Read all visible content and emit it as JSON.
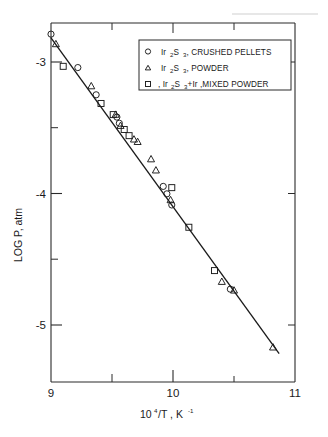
{
  "chart_data": {
    "type": "scatter",
    "title": "",
    "xlabel": "10^4 /T, K^-1",
    "ylabel": "LOG P, atm",
    "xlim": [
      9,
      11
    ],
    "ylim": [
      -5.6,
      -2.7
    ],
    "xticks": [
      9,
      10,
      11
    ],
    "xtick_labels": [
      "9",
      "10",
      "11"
    ],
    "x_minor_ticks": [
      9.5,
      10.5
    ],
    "yticks": [
      -3,
      -4,
      -5
    ],
    "ytick_labels": [
      "-3",
      "-4",
      "-5"
    ],
    "y_minor_ticks": [
      -3.5,
      -4.5
    ],
    "grid": false,
    "legend_position": "upper right",
    "fit_line": {
      "x": [
        9.0,
        10.87
      ],
      "y": [
        -2.82,
        -5.37
      ]
    },
    "series": [
      {
        "name": "Ir2 S3, CRUSHED PELLETS",
        "marker": "circle",
        "points": [
          [
            9.0,
            -2.79
          ],
          [
            9.22,
            -3.06
          ],
          [
            9.37,
            -3.28
          ],
          [
            9.54,
            -3.46
          ],
          [
            9.56,
            -3.51
          ],
          [
            9.92,
            -4.02
          ],
          [
            9.95,
            -4.08
          ],
          [
            9.99,
            -4.17
          ],
          [
            10.47,
            -4.85
          ]
        ]
      },
      {
        "name": "Ir2 S3, POWDER",
        "marker": "triangle",
        "points": [
          [
            9.04,
            -2.87
          ],
          [
            9.33,
            -3.21
          ],
          [
            9.53,
            -3.44
          ],
          [
            9.57,
            -3.53
          ],
          [
            9.68,
            -3.64
          ],
          [
            9.71,
            -3.66
          ],
          [
            9.82,
            -3.8
          ],
          [
            9.86,
            -3.89
          ],
          [
            9.98,
            -4.13
          ],
          [
            10.4,
            -4.79
          ],
          [
            10.5,
            -4.86
          ],
          [
            10.82,
            -5.32
          ]
        ]
      },
      {
        "name": "Ir2 S3+Ir, MIXED POWDER",
        "marker": "square",
        "points": [
          [
            9.1,
            -3.05
          ],
          [
            9.41,
            -3.35
          ],
          [
            9.51,
            -3.44
          ],
          [
            9.6,
            -3.56
          ],
          [
            9.64,
            -3.61
          ],
          [
            9.99,
            -4.03
          ],
          [
            10.13,
            -4.35
          ],
          [
            10.34,
            -4.7
          ]
        ]
      }
    ]
  },
  "axes": {
    "y_title": "LOG P, atm",
    "x_title_parts": {
      "base": "10",
      "exponent": "4",
      "mid": "/T , K",
      "exponent2": "-1"
    },
    "x_tick_labels": [
      "9",
      "10",
      "11"
    ],
    "y_tick_labels": [
      "-3",
      "-4",
      "-5"
    ]
  },
  "legend": {
    "entries": [
      {
        "marker": "circle-marker",
        "formula_lead": "Ir",
        "formula_sub1": "2",
        "formula_mid": " S",
        "formula_sub2": "3",
        "tail": ", CRUSHED PELLETS"
      },
      {
        "marker": "triangle-marker",
        "formula_lead": "Ir",
        "formula_sub1": "2",
        "formula_mid": " S",
        "formula_sub2": "3",
        "tail": ", POWDER"
      },
      {
        "marker": "square-marker",
        "formula_lead": ", Ir",
        "formula_sub1": "2",
        "formula_mid": " S",
        "formula_sub2": "3",
        "tail": "+Ir ,MIXED POWDER"
      }
    ]
  }
}
